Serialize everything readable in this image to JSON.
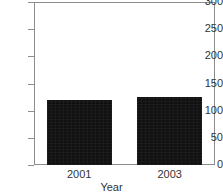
{
  "chart_data": {
    "type": "bar",
    "title": "",
    "xlabel": "Year",
    "ylabel": "",
    "categories": [
      "2001",
      "2003"
    ],
    "values": [
      119,
      125
    ],
    "ylim": [
      0,
      300
    ],
    "yticks": [
      0,
      50,
      100,
      150,
      200,
      250,
      300
    ],
    "ytick_labels": [
      "0",
      "50",
      "100",
      "150",
      "200",
      "250",
      "300"
    ],
    "grid": false,
    "legend": null,
    "bar_color": "#111111",
    "axis_color": "#8c8c8c",
    "text_color": "#333333"
  },
  "axis": {
    "x_title": "Year"
  }
}
